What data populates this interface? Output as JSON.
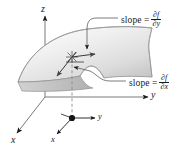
{
  "figure": {
    "background_color": "#ffffff",
    "ink_color": "#1a1a1a",
    "surface": {
      "fill_light": "#fbfbfb",
      "fill_dark": "#c9c9c9",
      "edge_color": "#6e6e6e",
      "description": "curved sheet over the xy-plane"
    }
  },
  "axes": {
    "z_label": "z",
    "y_label": "y",
    "x_label": "x",
    "local_y_label": "y",
    "local_x_label": "x"
  },
  "annotations": [
    {
      "id": "slope-dfdy",
      "word": "slope",
      "equals": "=",
      "numerator": "∂f",
      "denominator": "∂y"
    },
    {
      "id": "slope-dfdx",
      "word": "slope",
      "equals": "=",
      "numerator": "∂f",
      "denominator": "∂x"
    }
  ],
  "points": {
    "base_point_marker": "filled-dot",
    "surface_point_marker": "star"
  }
}
